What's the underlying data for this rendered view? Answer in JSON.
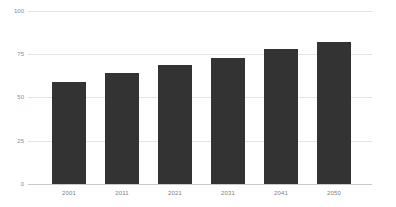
{
  "chart_data": {
    "type": "bar",
    "title": "",
    "subtitle": "",
    "xlabel": "",
    "ylabel": "",
    "categories": [
      "2001",
      "2011",
      "2021",
      "2031",
      "2041",
      "2050"
    ],
    "values": [
      59,
      64,
      69,
      73,
      78,
      82
    ],
    "series": [
      {
        "name": "",
        "values": [
          59,
          64,
          69,
          73,
          78,
          82
        ]
      }
    ],
    "ylim": [
      0,
      100
    ],
    "yticks": [
      0,
      25,
      50,
      75,
      100
    ],
    "ytick_labels": [
      "0",
      "25",
      "50",
      "75",
      "100"
    ],
    "grid": true,
    "grid_axis": "y",
    "legend": false,
    "legend_position": "none",
    "annotations": [],
    "bar_color": "#333333",
    "grid_color": "#e3e3e3",
    "axis_color": "#c9c9c9",
    "tick_label_color": "#8a8a8a",
    "background_color": "#ffffff"
  },
  "axes": {
    "y": {
      "ticks": [
        {
          "label": "100",
          "value": 100
        },
        {
          "label": "75",
          "value": 75
        },
        {
          "label": "50",
          "value": 50
        },
        {
          "label": "25",
          "value": 25
        },
        {
          "label": "0",
          "value": 0
        }
      ]
    },
    "x": {
      "ticks": [
        {
          "label": "2001"
        },
        {
          "label": "2011"
        },
        {
          "label": "2021"
        },
        {
          "label": "2031"
        },
        {
          "label": "2041"
        },
        {
          "label": "2050"
        }
      ]
    }
  },
  "bars": [
    {
      "category": "2001",
      "value": 59
    },
    {
      "category": "2011",
      "value": 64
    },
    {
      "category": "2021",
      "value": 69
    },
    {
      "category": "2031",
      "value": 73
    },
    {
      "category": "2041",
      "value": 78
    },
    {
      "category": "2050",
      "value": 82
    }
  ]
}
